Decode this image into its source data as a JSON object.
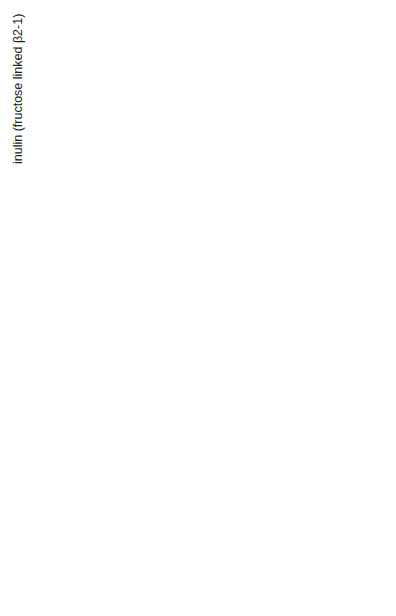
{
  "figure": {
    "orientation": "rotated-90-ccw",
    "panels": [
      {
        "id": "inulin",
        "label": "inulin (fructose linked β2-1)",
        "units": 4,
        "ring": "furanose",
        "groups": [
          "OH",
          "CH₂",
          "O",
          "HO",
          "OH",
          "HO–CH₂"
        ]
      },
      {
        "id": "cellulose",
        "label": "cellulose (glucose linked β1-4)",
        "units": 4,
        "ring": "pyranose",
        "groups": [
          "CH₂OH",
          "O",
          "OH",
          "OH"
        ]
      },
      {
        "id": "chitin",
        "label": "chitin (N-acetylglucosamine linked β1-4)",
        "units": 4,
        "ring": "pyranose",
        "groups": [
          "CH₂OH",
          "O",
          "OH",
          "HN–C–CH₃",
          "=O"
        ]
      },
      {
        "id": "pectin",
        "label_line1": "pectin (galacturonic acid linked α1-4,",
        "label_line2": "partially methylated)",
        "units": 4,
        "ring": "pyranose",
        "groups": [
          "COOH",
          "O",
          "OH",
          "OH",
          "CH₃–C=O"
        ]
      }
    ]
  },
  "text": {
    "inulin_label": "inulin (fructose linked β2-1)",
    "cellulose_label": "cellulose (glucose linked β1-4)",
    "chitin_label_a": "chitin (",
    "chitin_label_n": "N",
    "chitin_label_b": "-acetylglucosamine linked β1-4)",
    "pectin_label_1": "pectin (galacturonic acid linked α1-4,",
    "pectin_label_2": "partially methylated)",
    "O": "O",
    "OH": "OH",
    "HO": "HO",
    "CH2": "CH",
    "CH2OH_a": "CH",
    "CH2OH_b": "OH",
    "sub2": "2",
    "sub3": "3",
    "HO_CH2": "HO–CH",
    "COOH": "COOH",
    "HN": "HN",
    "C": "C",
    "CH3": "CH",
    "dash": "–",
    "eqO": "=O"
  }
}
